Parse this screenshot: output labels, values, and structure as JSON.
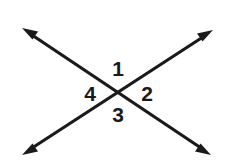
{
  "diagram": {
    "type": "geometry-angle-diagram",
    "background_color": "#ffffff",
    "stroke_color": "#1a1a1a",
    "stroke_width": 3.2,
    "canvas": {
      "width": 234,
      "height": 166
    },
    "intersection_point": {
      "x": 118,
      "y": 95
    },
    "lines": [
      {
        "name": "line-nw-se",
        "description": "double-headed arrow running from upper-left to lower-right",
        "start": {
          "x": 22,
          "y": 28
        },
        "end": {
          "x": 211,
          "y": 155
        },
        "arrowhead_start": true,
        "arrowhead_end": true
      },
      {
        "name": "line-sw-ne",
        "description": "double-headed arrow running from lower-left to upper-right",
        "start": {
          "x": 22,
          "y": 155
        },
        "end": {
          "x": 213,
          "y": 30
        },
        "arrowhead_start": true,
        "arrowhead_end": true
      }
    ],
    "angle_labels": [
      {
        "id": "1",
        "text": "1",
        "position": "top",
        "x": 118,
        "y": 68
      },
      {
        "id": "2",
        "text": "2",
        "position": "right",
        "x": 147,
        "y": 93
      },
      {
        "id": "3",
        "text": "3",
        "position": "bottom",
        "x": 118,
        "y": 114
      },
      {
        "id": "4",
        "text": "4",
        "position": "left",
        "x": 90,
        "y": 93
      }
    ]
  }
}
